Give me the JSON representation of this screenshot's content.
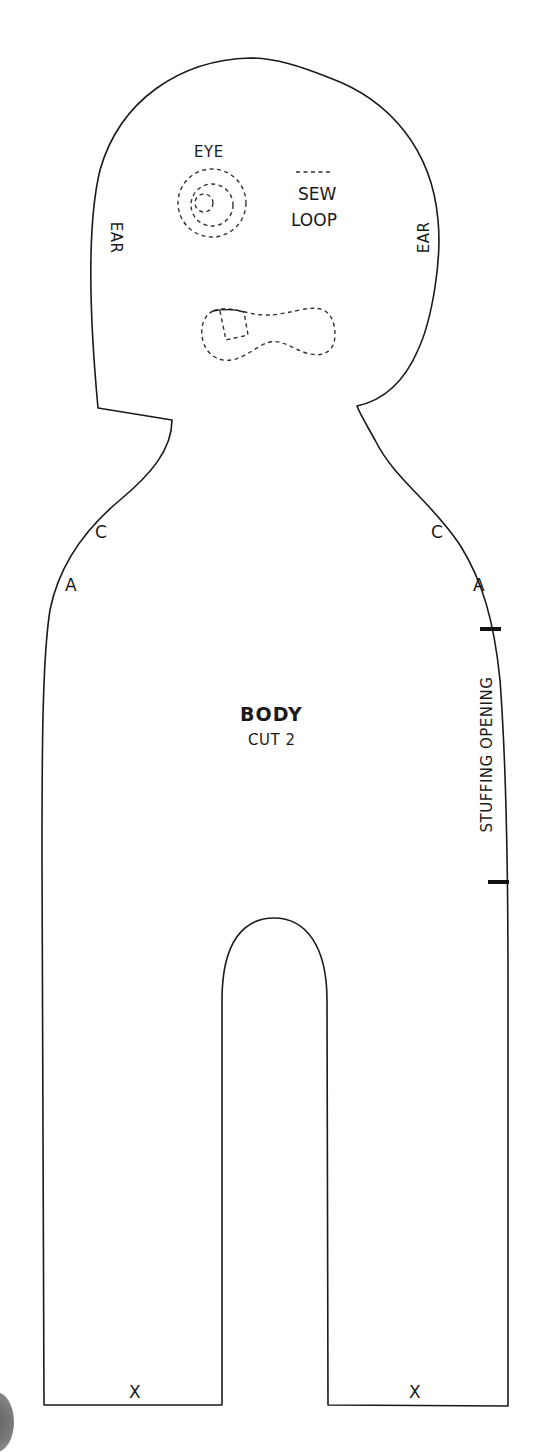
{
  "pattern": {
    "piece_name": "BODY",
    "cut_instruction": "CUT 2",
    "outline_color": "#1a1a1a",
    "background_color": "#ffffff"
  },
  "labels": {
    "eye": "EYE",
    "sew_loop_line1": "SEW",
    "sew_loop_line2": "LOOP",
    "ear_left": "EAR",
    "ear_right": "EAR",
    "c_left": "C",
    "c_right": "C",
    "a_left": "A",
    "a_right": "A",
    "stuffing_opening": "STUFFING OPENING",
    "x_left": "X",
    "x_right": "X"
  },
  "icons": {
    "eye_marking": "concentric-dashed-circles",
    "mouth_marking": "dashed-dogbone-shape",
    "sew_loop_marking": "short-dashed-line",
    "stuffing_notches": "bold-notch-marks"
  }
}
